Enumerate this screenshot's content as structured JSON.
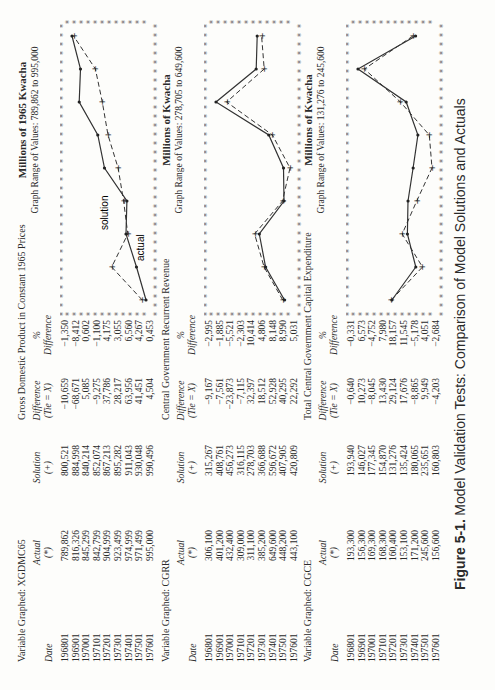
{
  "figure": {
    "number": "Figure 5-1.",
    "title": "Model Validation Tests: Comparison of Model Solutions and Actuals"
  },
  "headers": {
    "date": "Date",
    "actual": "Actual",
    "actual_sym": "(*)",
    "solution": "Solution",
    "solution_sym": "(+)",
    "difference": "Difference",
    "difference_formula": "(Tie = X)",
    "pct_sym": "%",
    "pct_difference": "Difference"
  },
  "sections": [
    {
      "variable_label": "Variable Graphed: XGDMC65",
      "title": "Gross Domestic Product in Constant 1965 Prices",
      "graph_unit": "Millions of 1965 Kwacha",
      "graph_range": "Graph Range of Values: 789,862 to 995,000",
      "legend_actual": "actual",
      "legend_solution": "solution",
      "dates": [
        "196801",
        "196901",
        "197001",
        "197101",
        "197201",
        "197301",
        "197401",
        "197501",
        "197601"
      ],
      "actual": [
        "789,862",
        "816,326",
        "845,299",
        "842,799",
        "904,999",
        "923,499",
        "974,999",
        "971,499",
        "995,000"
      ],
      "solution": [
        "800,521",
        "884,998",
        "840,214",
        "852,074",
        "867,213",
        "895,282",
        "911,043",
        "930,048",
        "990,496"
      ],
      "difference": [
        "−10,659",
        "−68,671",
        "5,085",
        "−9,275",
        "37,786",
        "28,217",
        "63,956",
        "41,451",
        "4,504"
      ],
      "pct_difference": [
        "−1,350",
        "−8,412",
        "0,602",
        "−1,100",
        "4,175",
        "3,055",
        "6,560",
        "4,267",
        "0,453"
      ]
    },
    {
      "variable_label": "Variable Graphed: CGRR",
      "title": "Central Government Recurrent Revenue",
      "graph_unit": "Millions of Kwacha",
      "graph_range": "Graph Range of Values: 278,705 to 649,600",
      "dates": [
        "196801",
        "196901",
        "197001",
        "197101",
        "197201",
        "197301",
        "197401",
        "197501",
        "197601"
      ],
      "actual": [
        "306,100",
        "401,200",
        "432,400",
        "309,000",
        "311,100",
        "385,200",
        "649,600",
        "448,200",
        "443,100"
      ],
      "solution": [
        "315,267",
        "408,761",
        "456,273",
        "316,115",
        "278,703",
        "366,688",
        "596,672",
        "407,905",
        "420,809"
      ],
      "difference": [
        "−9,167",
        "−7,561",
        "−23,873",
        "−7,115",
        "32,397",
        "18,512",
        "52,928",
        "40,295",
        "22,292"
      ],
      "pct_difference": [
        "−2,995",
        "−1,885",
        "−5,521",
        "−2,303",
        "10,414",
        "4,806",
        "8,148",
        "8,990",
        "5,031"
      ]
    },
    {
      "variable_label": "Variable Graphed: CGCE",
      "title": "Total Central Government Capital Expenditure",
      "graph_unit": "Millions of Kwacha",
      "graph_range": "Graph Range of Values: 131,276 to 245,600",
      "dates": [
        "196801",
        "196901",
        "197001",
        "197101",
        "197201",
        "197301",
        "197401",
        "197501",
        "197601"
      ],
      "actual": [
        "193,300",
        "156,300",
        "169,300",
        "168,300",
        "160,400",
        "153,100",
        "171,200",
        "245,600",
        "156,600"
      ],
      "solution": [
        "193,940",
        "146,027",
        "177,345",
        "154,870",
        "131,276",
        "135,424",
        "180,065",
        "235,651",
        "160,803"
      ],
      "difference": [
        "−0,640",
        "10,273",
        "−8,045",
        "13,430",
        "29,124",
        "17,676",
        "−8,865",
        "9,949",
        "−4,203"
      ],
      "pct_difference": [
        "−0,331",
        "6,573",
        "−4,752",
        "7,980",
        "18,157",
        "11,545",
        "−5,178",
        "4,051",
        "−2,684"
      ]
    }
  ],
  "chart_data": [
    {
      "type": "line",
      "title": "Gross Domestic Product in Constant 1965 Prices",
      "ylabel": "Millions of 1965 Kwacha",
      "subtitle": "Graph Range of Values: 789,862 to 995,000",
      "categories": [
        "196801",
        "196901",
        "197001",
        "197101",
        "197201",
        "197301",
        "197401",
        "197501",
        "197601"
      ],
      "series": [
        {
          "name": "actual (*)",
          "values": [
            789.862,
            816.326,
            845.299,
            842.799,
            904.999,
            923.499,
            974.999,
            971.499,
            995.0
          ]
        },
        {
          "name": "solution (+)",
          "values": [
            800.521,
            884.998,
            840.214,
            852.074,
            867.213,
            895.282,
            911.043,
            930.048,
            990.496
          ]
        }
      ],
      "ylim": [
        789.862,
        995.0
      ],
      "grid": false
    },
    {
      "type": "line",
      "title": "Central Government Recurrent Revenue",
      "ylabel": "Millions of Kwacha",
      "subtitle": "Graph Range of Values: 278,705 to 649,600",
      "categories": [
        "196801",
        "196901",
        "197001",
        "197101",
        "197201",
        "197301",
        "197401",
        "197501",
        "197601"
      ],
      "series": [
        {
          "name": "actual (*)",
          "values": [
            306.1,
            401.2,
            432.4,
            309.0,
            311.1,
            385.2,
            649.6,
            448.2,
            443.1
          ]
        },
        {
          "name": "solution (+)",
          "values": [
            315.267,
            408.761,
            456.273,
            316.115,
            278.703,
            366.688,
            596.672,
            407.905,
            420.809
          ]
        }
      ],
      "ylim": [
        278.705,
        649.6
      ],
      "grid": false
    },
    {
      "type": "line",
      "title": "Total Central Government Capital Expenditure",
      "ylabel": "Millions of Kwacha",
      "subtitle": "Graph Range of Values: 131,276 to 245,600",
      "categories": [
        "196801",
        "196901",
        "197001",
        "197101",
        "197201",
        "197301",
        "197401",
        "197501",
        "197601"
      ],
      "series": [
        {
          "name": "actual (*)",
          "values": [
            193.3,
            156.3,
            169.3,
            168.3,
            160.4,
            153.1,
            171.2,
            245.6,
            156.6
          ]
        },
        {
          "name": "solution (+)",
          "values": [
            193.94,
            146.027,
            177.345,
            154.87,
            131.276,
            135.424,
            180.065,
            235.651,
            160.803
          ]
        }
      ],
      "ylim": [
        131.276,
        245.6
      ],
      "grid": false
    }
  ]
}
